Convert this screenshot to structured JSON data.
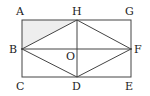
{
  "diagram": {
    "shade_color": "#eeeeee",
    "line_color": "#444444",
    "points": {
      "A": {
        "label": "A",
        "x": 22,
        "y": 20
      },
      "H": {
        "label": "H",
        "x": 77,
        "y": 20
      },
      "G": {
        "label": "G",
        "x": 131,
        "y": 20
      },
      "B": {
        "label": "B",
        "x": 22,
        "y": 49
      },
      "O": {
        "label": "O",
        "x": 77,
        "y": 49
      },
      "F": {
        "label": "F",
        "x": 131,
        "y": 49
      },
      "C": {
        "label": "C",
        "x": 22,
        "y": 77
      },
      "D": {
        "label": "D",
        "x": 77,
        "y": 77
      },
      "E": {
        "label": "E",
        "x": 131,
        "y": 77
      }
    },
    "segments": [
      "AG",
      "GE",
      "EC",
      "CA",
      "HB",
      "BD",
      "DF",
      "FH",
      "HD",
      "BF"
    ],
    "shaded_region": [
      "A",
      "B",
      "H"
    ]
  }
}
